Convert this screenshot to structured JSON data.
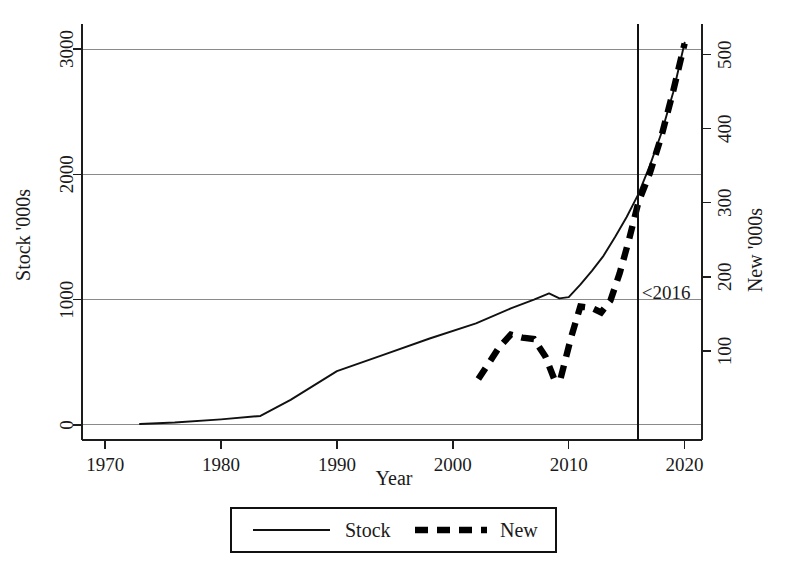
{
  "chart_data": {
    "type": "line",
    "title": "",
    "xlabel": "Year",
    "ylabel": "Stock '000s",
    "y2label": "New '000s",
    "xlim": [
      1968,
      2021.5
    ],
    "ylim": [
      -120,
      3200
    ],
    "y2lim": [
      -20.3,
      541.4
    ],
    "xticks": [
      1970,
      1980,
      1990,
      2000,
      2010,
      2020
    ],
    "xticklabels": [
      "1970",
      "1980",
      "1990",
      "2000",
      "2010",
      "2020"
    ],
    "yticks": [
      0,
      1000,
      2000,
      3000
    ],
    "yticklabels": [
      "0",
      "1000",
      "2000",
      "3000"
    ],
    "y2ticks": [
      100,
      200,
      300,
      400,
      500
    ],
    "y2ticklabels": [
      "100",
      "200",
      "300",
      "400",
      "500"
    ],
    "grid": "horizontal",
    "gridlines": [
      0,
      1000,
      2000,
      3000
    ],
    "legend_position": "below-center",
    "annotations": [
      {
        "name": "reference-line-2016",
        "text": "<2016",
        "x": 2016,
        "type": "vertical-line-with-label",
        "label_x": 2016.3,
        "label_y": 170
      }
    ],
    "series": [
      {
        "name": "Stock",
        "axis": "left",
        "style": "solid",
        "color": "#111111",
        "x": [
          1973,
          1976,
          1980,
          1983.4,
          1986,
          1990,
          1994,
          1998,
          2002,
          2005,
          2007,
          2008.3,
          2009.2,
          2010,
          2011,
          2012,
          2013,
          2014,
          2015,
          2016,
          2017,
          2018,
          2019,
          2020
        ],
        "y": [
          8,
          20,
          45,
          72,
          200,
          430,
          560,
          690,
          810,
          930,
          1000,
          1050,
          1010,
          1020,
          1120,
          1230,
          1350,
          1500,
          1660,
          1840,
          2070,
          2330,
          2650,
          3050
        ]
      },
      {
        "name": "New",
        "axis": "right",
        "style": "dashed",
        "color": "#000000",
        "x": [
          2002.2,
          2004,
          2005,
          2006,
          2007,
          2008,
          2008.8,
          2009.3,
          2010.2,
          2011,
          2012,
          2012.8,
          2013.6,
          2014.4,
          2015.2,
          2016,
          2017,
          2018,
          2019,
          2020
        ],
        "y": [
          62,
          105,
          122,
          118,
          116,
          92,
          60,
          63,
          118,
          160,
          158,
          152,
          168,
          205,
          250,
          300,
          340,
          390,
          450,
          515
        ]
      }
    ],
    "legend": [
      {
        "label": "Stock",
        "style": "solid"
      },
      {
        "label": "New",
        "style": "dashed"
      }
    ]
  }
}
